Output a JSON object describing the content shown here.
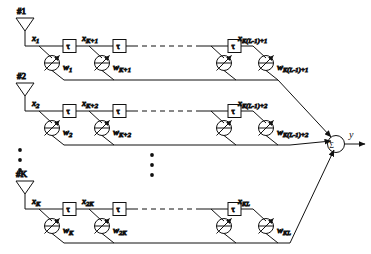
{
  "figure": {
    "type": "antenna-array-tapped-delay-line-beamformer",
    "output_label": "y",
    "sum_symbol": "Σ",
    "delay_symbol": "τ",
    "vertical_ellipsis": "•",
    "colors": {
      "line": "#111111",
      "background": "#ffffff",
      "text": "#111111"
    }
  },
  "branches": [
    {
      "antenna_label": "#1",
      "row_index": 0,
      "taps": [
        {
          "signal": "x",
          "signal_sub": "1",
          "weight": "w",
          "weight_sub": "1"
        },
        {
          "signal": "x",
          "signal_sub": "K+1",
          "weight": "w",
          "weight_sub": "K+1"
        },
        {
          "signal": "x",
          "signal_sub": "K(L-1)+1",
          "weight": "w",
          "weight_sub": "K(L-1)+1"
        }
      ]
    },
    {
      "antenna_label": "#2",
      "row_index": 1,
      "taps": [
        {
          "signal": "x",
          "signal_sub": "2",
          "weight": "w",
          "weight_sub": "2"
        },
        {
          "signal": "x",
          "signal_sub": "K+2",
          "weight": "w",
          "weight_sub": "K+2"
        },
        {
          "signal": "x",
          "signal_sub": "K(L-1)+2",
          "weight": "w",
          "weight_sub": "K(L-1)+2"
        }
      ]
    },
    {
      "antenna_label": "#K",
      "row_index": 2,
      "taps": [
        {
          "signal": "x",
          "signal_sub": "K",
          "weight": "w",
          "weight_sub": "K"
        },
        {
          "signal": "x",
          "signal_sub": "2K",
          "weight": "w",
          "weight_sub": "2K"
        },
        {
          "signal": "x",
          "signal_sub": "KL",
          "weight": "w",
          "weight_sub": "KL"
        }
      ]
    }
  ]
}
